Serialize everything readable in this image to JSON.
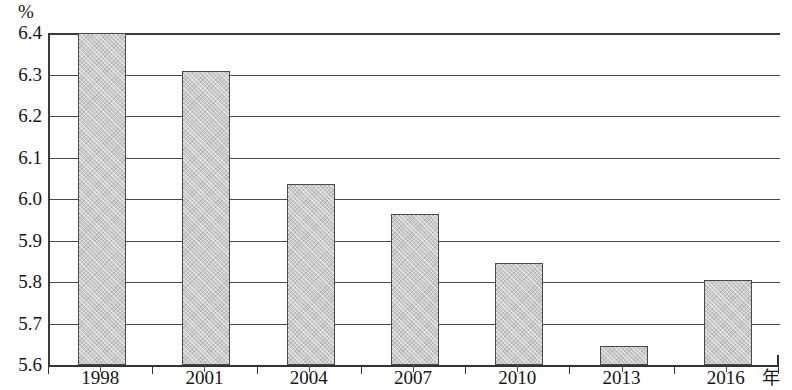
{
  "chart_data": {
    "type": "bar",
    "title": "",
    "subtitle": "",
    "xlabel": "年",
    "ylabel": "%",
    "categories": [
      "1998",
      "2001",
      "2004",
      "2007",
      "2010",
      "2013",
      "2016"
    ],
    "values": [
      6.4,
      6.308,
      6.035,
      5.964,
      5.845,
      5.645,
      5.805
    ],
    "series": [
      {
        "name": "",
        "values": [
          6.4,
          6.308,
          6.035,
          5.964,
          5.845,
          5.645,
          5.805
        ]
      }
    ],
    "ylim": [
      5.6,
      6.4
    ],
    "y_ticks": [
      "6.4",
      "6.3",
      "6.2",
      "6.1",
      "6.0",
      "5.9",
      "5.8",
      "5.7",
      "5.6"
    ],
    "y_tick_values": [
      6.4,
      6.3,
      6.2,
      6.1,
      6.0,
      5.9,
      5.8,
      5.7,
      5.6
    ],
    "grid": true,
    "grid_axis": "y",
    "legend": false,
    "legend_position": "none",
    "bar_color": "#cacaca",
    "bar_border_color": "#4a4a4a",
    "axis_color": "#333333",
    "gridline_color": "#4a4a4a",
    "background_color": "#fefefe",
    "annotations": []
  },
  "axes": {
    "y_unit_label": "%",
    "x_unit_label": "年"
  }
}
